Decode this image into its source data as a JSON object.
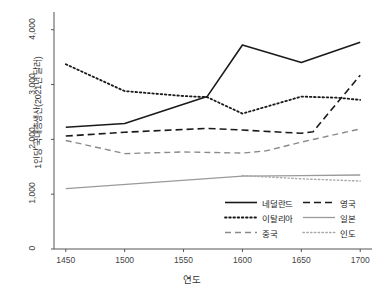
{
  "chart_data": {
    "type": "line",
    "title": "",
    "subtitle": "",
    "xlabel": "연도",
    "ylabel": "1인당 국내총생산(2021년 달러)",
    "xlim": [
      1440,
      1710
    ],
    "ylim": [
      0,
      4250
    ],
    "xticks": [
      1450,
      1500,
      1550,
      1600,
      1650,
      1700
    ],
    "xtick_labels": [
      "1450",
      "1500",
      "1550",
      "1600",
      "1650",
      "1700"
    ],
    "yticks": [
      0,
      1000,
      2000,
      3000,
      4000
    ],
    "ytick_labels": [
      "0",
      "1,000",
      "2,000",
      "3,000",
      "4,000"
    ],
    "grid": false,
    "legend_position": "lower right",
    "series": [
      {
        "name": "네덜란드",
        "style": "solid",
        "color": "#1a1a1a",
        "width": 1.6,
        "x": [
          1450,
          1500,
          1570,
          1600,
          1650,
          1700
        ],
        "values": [
          2220,
          2290,
          2780,
          3720,
          3400,
          3770
        ]
      },
      {
        "name": "영국",
        "style": "dashed",
        "color": "#1a1a1a",
        "width": 1.6,
        "x": [
          1450,
          1500,
          1550,
          1570,
          1600,
          1650,
          1660,
          1700
        ],
        "values": [
          2060,
          2130,
          2180,
          2200,
          2170,
          2110,
          2140,
          3170
        ]
      },
      {
        "name": "이탈리아",
        "style": "dotted",
        "color": "#1a1a1a",
        "width": 1.8,
        "x": [
          1450,
          1500,
          1550,
          1570,
          1600,
          1650,
          1680,
          1700
        ],
        "values": [
          3370,
          2880,
          2790,
          2770,
          2470,
          2780,
          2760,
          2720
        ]
      },
      {
        "name": "일본",
        "style": "solid",
        "color": "#9a9a9a",
        "width": 1.3,
        "x": [
          1450,
          1600,
          1650,
          1700
        ],
        "values": [
          1100,
          1330,
          1340,
          1350
        ]
      },
      {
        "name": "중국",
        "style": "dashed",
        "color": "#8a8a8a",
        "width": 1.4,
        "x": [
          1450,
          1500,
          1550,
          1600,
          1620,
          1650,
          1700
        ],
        "values": [
          1980,
          1740,
          1770,
          1750,
          1790,
          1950,
          2190
        ]
      },
      {
        "name": "인도",
        "style": "dotted",
        "color": "#a8a8a8",
        "width": 1.4,
        "x": [
          1600,
          1650,
          1700
        ],
        "values": [
          1340,
          1280,
          1240
        ]
      }
    ]
  },
  "axes": {
    "y_title": "1인당 국내총생산(2021년 달러)",
    "x_title": "연도",
    "y_ticks": [
      "0",
      "1,000",
      "2,000",
      "3,000",
      "4,000"
    ],
    "x_ticks": [
      "1450",
      "1500",
      "1550",
      "1600",
      "1650",
      "1700"
    ]
  },
  "legend": {
    "items": [
      {
        "label": "네덜란드",
        "key": "solid-black-line-key"
      },
      {
        "label": "영국",
        "key": "dashed-black-line-key"
      },
      {
        "label": "이탈리아",
        "key": "dotted-black-line-key"
      },
      {
        "label": "일본",
        "key": "solid-gray-line-key"
      },
      {
        "label": "중국",
        "key": "dashed-gray-line-key"
      },
      {
        "label": "인도",
        "key": "dotted-gray-line-key"
      }
    ]
  },
  "colors": {
    "axis": "#555555",
    "text": "#222222",
    "background": "#ffffff",
    "dark_series": "#1a1a1a",
    "light_series": "#9a9a9a"
  }
}
